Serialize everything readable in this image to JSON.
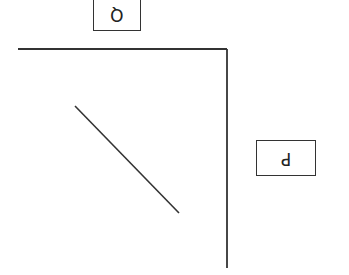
{
  "diagram": {
    "labels": {
      "q": "Q",
      "p": "P"
    },
    "orientation": "rotated-180",
    "axes": {
      "horizontal": {
        "x1": 18,
        "y1": 49,
        "x2": 227,
        "y2": 49
      },
      "vertical": {
        "x1": 227,
        "y1": 49,
        "x2": 227,
        "y2": 268
      }
    },
    "line": {
      "x1": 75,
      "y1": 106,
      "x2": 179,
      "y2": 213
    },
    "colors": {
      "stroke": "#333333",
      "background": "#ffffff"
    }
  }
}
